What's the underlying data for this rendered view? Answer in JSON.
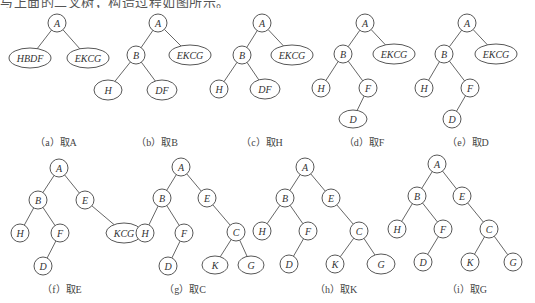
{
  "header_text": "与上面的二叉树，构造过程如图所示。",
  "colors": {
    "stroke": "#444444",
    "text": "#333333",
    "background": "#ffffff"
  },
  "panels": [
    {
      "id": "a",
      "caption": "（a）取A",
      "nodes": [
        {
          "id": "A",
          "label": "A",
          "x": 57,
          "y": 23,
          "rx": 9,
          "ry": 9
        },
        {
          "id": "HBDF",
          "label": "HBDF",
          "x": 30,
          "y": 58,
          "rx": 21,
          "ry": 10
        },
        {
          "id": "EKCG",
          "label": "EKCG",
          "x": 88,
          "y": 58,
          "rx": 21,
          "ry": 10
        }
      ],
      "edges": [
        [
          "A",
          "HBDF"
        ],
        [
          "A",
          "EKCG"
        ]
      ],
      "caption_pos": [
        56,
        146
      ]
    },
    {
      "id": "b",
      "caption": "（b）取B",
      "nodes": [
        {
          "id": "A",
          "label": "A",
          "x": 158,
          "y": 23,
          "rx": 9,
          "ry": 9
        },
        {
          "id": "B",
          "label": "B",
          "x": 136,
          "y": 55,
          "rx": 9,
          "ry": 9
        },
        {
          "id": "EKCG",
          "label": "EKCG",
          "x": 190,
          "y": 55,
          "rx": 21,
          "ry": 10
        },
        {
          "id": "H",
          "label": "H",
          "x": 108,
          "y": 90,
          "rx": 14,
          "ry": 10
        },
        {
          "id": "DF",
          "label": "DF",
          "x": 162,
          "y": 90,
          "rx": 15,
          "ry": 10
        }
      ],
      "edges": [
        [
          "A",
          "B"
        ],
        [
          "A",
          "EKCG"
        ],
        [
          "B",
          "H"
        ],
        [
          "B",
          "DF"
        ]
      ],
      "caption_pos": [
        157,
        146
      ]
    },
    {
      "id": "c",
      "caption": "（c）取H",
      "nodes": [
        {
          "id": "A",
          "label": "A",
          "x": 262,
          "y": 23,
          "rx": 9,
          "ry": 9
        },
        {
          "id": "B",
          "label": "B",
          "x": 242,
          "y": 55,
          "rx": 9,
          "ry": 9
        },
        {
          "id": "EKCG",
          "label": "EKCG",
          "x": 292,
          "y": 55,
          "rx": 21,
          "ry": 10
        },
        {
          "id": "H",
          "label": "H",
          "x": 219,
          "y": 89,
          "rx": 9,
          "ry": 9
        },
        {
          "id": "DF",
          "label": "DF",
          "x": 265,
          "y": 89,
          "rx": 15,
          "ry": 10
        }
      ],
      "edges": [
        [
          "A",
          "B"
        ],
        [
          "A",
          "EKCG"
        ],
        [
          "B",
          "H"
        ],
        [
          "B",
          "DF"
        ]
      ],
      "caption_pos": [
        262,
        146
      ]
    },
    {
      "id": "d",
      "caption": "（d）取F",
      "nodes": [
        {
          "id": "A",
          "label": "A",
          "x": 365,
          "y": 23,
          "rx": 9,
          "ry": 9
        },
        {
          "id": "B",
          "label": "B",
          "x": 343,
          "y": 54,
          "rx": 9,
          "ry": 9
        },
        {
          "id": "EKCG",
          "label": "EKCG",
          "x": 394,
          "y": 54,
          "rx": 21,
          "ry": 10
        },
        {
          "id": "H",
          "label": "H",
          "x": 321,
          "y": 88,
          "rx": 9,
          "ry": 9
        },
        {
          "id": "F",
          "label": "F",
          "x": 368,
          "y": 88,
          "rx": 9,
          "ry": 9
        },
        {
          "id": "D",
          "label": "D",
          "x": 353,
          "y": 119,
          "rx": 14,
          "ry": 9
        }
      ],
      "edges": [
        [
          "A",
          "B"
        ],
        [
          "A",
          "EKCG"
        ],
        [
          "B",
          "H"
        ],
        [
          "B",
          "F"
        ],
        [
          "F",
          "D"
        ]
      ],
      "caption_pos": [
        364,
        146
      ]
    },
    {
      "id": "e",
      "caption": "（e）取D",
      "nodes": [
        {
          "id": "A",
          "label": "A",
          "x": 467,
          "y": 23,
          "rx": 9,
          "ry": 9
        },
        {
          "id": "B",
          "label": "B",
          "x": 444,
          "y": 54,
          "rx": 9,
          "ry": 9
        },
        {
          "id": "EKCG",
          "label": "EKCG",
          "x": 496,
          "y": 54,
          "rx": 21,
          "ry": 10
        },
        {
          "id": "H",
          "label": "H",
          "x": 424,
          "y": 88,
          "rx": 9,
          "ry": 9
        },
        {
          "id": "F",
          "label": "F",
          "x": 470,
          "y": 88,
          "rx": 9,
          "ry": 9
        },
        {
          "id": "D",
          "label": "D",
          "x": 452,
          "y": 119,
          "rx": 9,
          "ry": 9
        }
      ],
      "edges": [
        [
          "A",
          "B"
        ],
        [
          "A",
          "EKCG"
        ],
        [
          "B",
          "H"
        ],
        [
          "B",
          "F"
        ],
        [
          "F",
          "D"
        ]
      ],
      "caption_pos": [
        468,
        146
      ]
    },
    {
      "id": "f",
      "caption": "（f）取E",
      "nodes": [
        {
          "id": "A",
          "label": "A",
          "x": 59,
          "y": 168,
          "rx": 9,
          "ry": 9
        },
        {
          "id": "B",
          "label": "B",
          "x": 38,
          "y": 200,
          "rx": 9,
          "ry": 9
        },
        {
          "id": "E",
          "label": "E",
          "x": 85,
          "y": 200,
          "rx": 9,
          "ry": 9
        },
        {
          "id": "H",
          "label": "H",
          "x": 20,
          "y": 233,
          "rx": 9,
          "ry": 9
        },
        {
          "id": "F",
          "label": "F",
          "x": 60,
          "y": 233,
          "rx": 9,
          "ry": 9
        },
        {
          "id": "KCG",
          "label": "KCG",
          "x": 124,
          "y": 233,
          "rx": 18,
          "ry": 10
        },
        {
          "id": "D",
          "label": "D",
          "x": 43,
          "y": 266,
          "rx": 9,
          "ry": 9
        }
      ],
      "edges": [
        [
          "A",
          "B"
        ],
        [
          "A",
          "E"
        ],
        [
          "B",
          "H"
        ],
        [
          "B",
          "F"
        ],
        [
          "E",
          "KCG"
        ],
        [
          "F",
          "D"
        ]
      ],
      "caption_pos": [
        62,
        293
      ]
    },
    {
      "id": "g",
      "caption": "（g）取C",
      "nodes": [
        {
          "id": "A",
          "label": "A",
          "x": 181,
          "y": 167,
          "rx": 9,
          "ry": 9
        },
        {
          "id": "B",
          "label": "B",
          "x": 162,
          "y": 198,
          "rx": 9,
          "ry": 9
        },
        {
          "id": "E",
          "label": "E",
          "x": 207,
          "y": 198,
          "rx": 9,
          "ry": 9
        },
        {
          "id": "H",
          "label": "H",
          "x": 145,
          "y": 233,
          "rx": 9,
          "ry": 9
        },
        {
          "id": "F",
          "label": "F",
          "x": 184,
          "y": 233,
          "rx": 9,
          "ry": 9
        },
        {
          "id": "C",
          "label": "C",
          "x": 236,
          "y": 232,
          "rx": 9,
          "ry": 9
        },
        {
          "id": "D",
          "label": "D",
          "x": 168,
          "y": 266,
          "rx": 9,
          "ry": 9
        },
        {
          "id": "K",
          "label": "K",
          "x": 215,
          "y": 265,
          "rx": 13,
          "ry": 9
        },
        {
          "id": "G",
          "label": "G",
          "x": 251,
          "y": 265,
          "rx": 13,
          "ry": 9
        }
      ],
      "edges": [
        [
          "A",
          "B"
        ],
        [
          "A",
          "E"
        ],
        [
          "B",
          "H"
        ],
        [
          "B",
          "F"
        ],
        [
          "E",
          "C"
        ],
        [
          "F",
          "D"
        ],
        [
          "C",
          "K"
        ],
        [
          "C",
          "G"
        ]
      ],
      "caption_pos": [
        185,
        293
      ]
    },
    {
      "id": "h",
      "caption": "（h）取K",
      "nodes": [
        {
          "id": "A",
          "label": "A",
          "x": 305,
          "y": 167,
          "rx": 9,
          "ry": 9
        },
        {
          "id": "B",
          "label": "B",
          "x": 285,
          "y": 198,
          "rx": 9,
          "ry": 9
        },
        {
          "id": "E",
          "label": "E",
          "x": 331,
          "y": 198,
          "rx": 9,
          "ry": 9
        },
        {
          "id": "H",
          "label": "H",
          "x": 262,
          "y": 231,
          "rx": 9,
          "ry": 9
        },
        {
          "id": "F",
          "label": "F",
          "x": 308,
          "y": 231,
          "rx": 9,
          "ry": 9
        },
        {
          "id": "C",
          "label": "C",
          "x": 359,
          "y": 231,
          "rx": 9,
          "ry": 9
        },
        {
          "id": "D",
          "label": "D",
          "x": 289,
          "y": 264,
          "rx": 9,
          "ry": 9
        },
        {
          "id": "K",
          "label": "K",
          "x": 335,
          "y": 264,
          "rx": 9,
          "ry": 9
        },
        {
          "id": "G",
          "label": "G",
          "x": 381,
          "y": 264,
          "rx": 14,
          "ry": 10
        }
      ],
      "edges": [
        [
          "A",
          "B"
        ],
        [
          "A",
          "E"
        ],
        [
          "B",
          "H"
        ],
        [
          "B",
          "F"
        ],
        [
          "E",
          "C"
        ],
        [
          "F",
          "D"
        ],
        [
          "C",
          "K"
        ],
        [
          "C",
          "G"
        ]
      ],
      "caption_pos": [
        336,
        293
      ]
    },
    {
      "id": "i",
      "caption": "（i）取G",
      "nodes": [
        {
          "id": "A",
          "label": "A",
          "x": 437,
          "y": 164,
          "rx": 9,
          "ry": 9
        },
        {
          "id": "B",
          "label": "B",
          "x": 417,
          "y": 196,
          "rx": 9,
          "ry": 9
        },
        {
          "id": "E",
          "label": "E",
          "x": 462,
          "y": 196,
          "rx": 9,
          "ry": 9
        },
        {
          "id": "H",
          "label": "H",
          "x": 397,
          "y": 229,
          "rx": 9,
          "ry": 9
        },
        {
          "id": "F",
          "label": "F",
          "x": 443,
          "y": 229,
          "rx": 9,
          "ry": 9
        },
        {
          "id": "C",
          "label": "C",
          "x": 489,
          "y": 229,
          "rx": 9,
          "ry": 9
        },
        {
          "id": "D",
          "label": "D",
          "x": 423,
          "y": 262,
          "rx": 9,
          "ry": 9
        },
        {
          "id": "K",
          "label": "K",
          "x": 470,
          "y": 262,
          "rx": 9,
          "ry": 9
        },
        {
          "id": "G",
          "label": "G",
          "x": 513,
          "y": 262,
          "rx": 9,
          "ry": 9
        }
      ],
      "edges": [
        [
          "A",
          "B"
        ],
        [
          "A",
          "E"
        ],
        [
          "B",
          "H"
        ],
        [
          "B",
          "F"
        ],
        [
          "E",
          "C"
        ],
        [
          "F",
          "D"
        ],
        [
          "C",
          "K"
        ],
        [
          "C",
          "G"
        ]
      ],
      "caption_pos": [
        467,
        293
      ]
    }
  ]
}
